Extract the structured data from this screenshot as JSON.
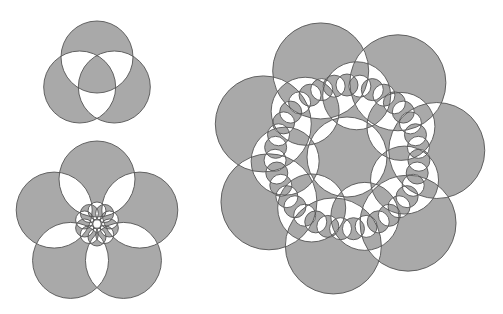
{
  "canvas": {
    "width": 503,
    "height": 314,
    "background": "#ffffff"
  },
  "style": {
    "fill": "#a9a9a9",
    "stroke": "#555555",
    "fill_rule": "evenodd"
  },
  "figures": [
    {
      "name": "three-circle-figure",
      "center": [
        97,
        77
      ],
      "rings": [
        {
          "count": 3,
          "ring_radius": 20,
          "circle_radius": 36,
          "start_angle_deg": -90
        }
      ]
    },
    {
      "name": "five-circle-figure",
      "center": [
        97,
        224
      ],
      "rings": [
        {
          "count": 5,
          "ring_radius": 45,
          "circle_radius": 38,
          "start_angle_deg": -90
        },
        {
          "count": 10,
          "ring_radius": 13,
          "circle_radius": 9,
          "start_angle_deg": -90
        }
      ]
    },
    {
      "name": "seven-circle-figure",
      "center": [
        347,
        157
      ],
      "rings": [
        {
          "count": 7,
          "ring_radius": 90,
          "circle_radius": 48,
          "start_angle_deg": -107
        },
        {
          "count": 7,
          "ring_radius": 62,
          "circle_radius": 34,
          "start_angle_deg": -81
        },
        {
          "count": 35,
          "ring_radius": 72,
          "circle_radius": 11,
          "start_angle_deg": -90
        },
        {
          "count": 1,
          "ring_radius": 0,
          "circle_radius": 40,
          "start_angle_deg": 0
        }
      ]
    }
  ]
}
